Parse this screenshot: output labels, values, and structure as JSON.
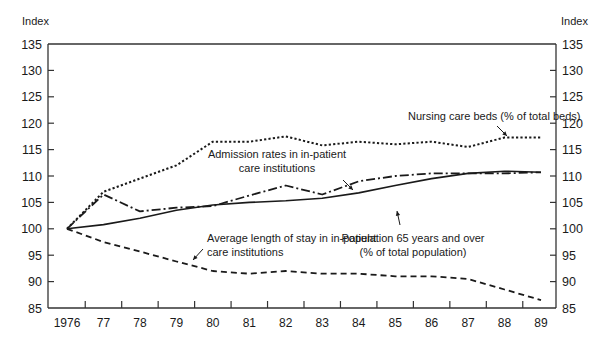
{
  "chart_data": {
    "type": "line",
    "title": "",
    "xlabel": "",
    "ylabel": "Index",
    "ylabel_right": "Index",
    "ylim": [
      85,
      135
    ],
    "yticks": [
      85,
      90,
      95,
      100,
      105,
      110,
      115,
      120,
      125,
      130,
      135
    ],
    "grid": false,
    "x": [
      "1976",
      "77",
      "78",
      "79",
      "80",
      "81",
      "82",
      "83",
      "84",
      "85",
      "86",
      "87",
      "88",
      "89"
    ],
    "series": [
      {
        "name": "Nursing care beds (% of total beds)",
        "style": "dotted",
        "values": [
          100,
          107,
          109.5,
          112,
          116.5,
          116.5,
          117.5,
          115.8,
          116.5,
          116,
          116.5,
          115.5,
          117.3,
          117.3
        ]
      },
      {
        "name": "Admission rates in in-patient care institutions",
        "style": "dash-dot",
        "values": [
          100,
          106.5,
          103.3,
          104,
          104.3,
          106.3,
          108.2,
          106.5,
          109,
          110,
          110.5,
          110.5,
          110.5,
          110.7
        ]
      },
      {
        "name": "Population 65 years and over (% of total population)",
        "style": "solid",
        "values": [
          100,
          100.8,
          102,
          103.5,
          104.5,
          105,
          105.3,
          105.8,
          106.8,
          108.2,
          109.5,
          110.5,
          110.9,
          110.7
        ]
      },
      {
        "name": "Average length of stay in in-patient care institutions",
        "style": "dashed",
        "values": [
          100,
          97.5,
          95.7,
          93.8,
          92,
          91.5,
          92,
          91.5,
          91.5,
          91,
          91,
          90.5,
          88.5,
          86.5
        ]
      }
    ],
    "annotations": [
      {
        "text_lines": [
          "Nursing care beds (% of total beds)"
        ],
        "series": 0
      },
      {
        "text_lines": [
          "Admission rates in in-patient",
          "care institutions"
        ],
        "series": 1
      },
      {
        "text_lines": [
          "Population 65 years and over",
          "(% of total population)"
        ],
        "series": 2
      },
      {
        "text_lines": [
          "Average length of stay in in-patient",
          "care institutions"
        ],
        "series": 3
      }
    ]
  },
  "colors": {
    "line": "#1a1a1a",
    "axis": "#333333",
    "background": "#ffffff"
  }
}
